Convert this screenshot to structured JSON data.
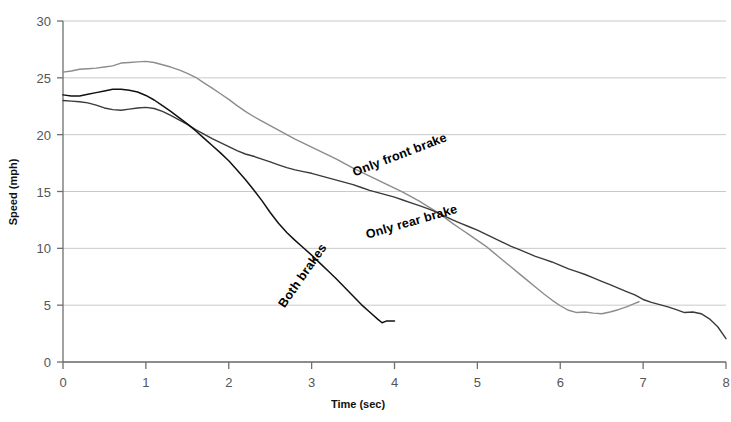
{
  "chart_data": {
    "type": "line",
    "title": "",
    "xlabel": "Time (sec)",
    "ylabel": "Speed (mph)",
    "xlim": [
      0,
      8
    ],
    "ylim": [
      0,
      30
    ],
    "xticks": [
      "0",
      "1",
      "2",
      "3",
      "4",
      "5",
      "6",
      "7",
      "8"
    ],
    "yticks": [
      "0",
      "5",
      "10",
      "15",
      "20",
      "25",
      "30"
    ],
    "grid": true,
    "legend_position": "inline-labels",
    "series": [
      {
        "name": "Only front brake",
        "color": "#8c8c8c",
        "label_x": 4.08,
        "label_y": 17.9,
        "label_rotation": -21,
        "x": [
          0.0,
          0.1,
          0.2,
          0.3,
          0.4,
          0.5,
          0.6,
          0.7,
          0.8,
          0.9,
          1.0,
          1.1,
          1.2,
          1.3,
          1.4,
          1.5,
          1.6,
          1.7,
          1.8,
          1.9,
          2.0,
          2.1,
          2.2,
          2.3,
          2.4,
          2.5,
          2.6,
          2.7,
          2.8,
          2.9,
          3.0,
          3.1,
          3.2,
          3.3,
          3.4,
          3.5,
          3.6,
          3.7,
          3.8,
          3.9,
          4.0,
          4.1,
          4.2,
          4.3,
          4.4,
          4.5,
          4.6,
          4.7,
          4.8,
          4.9,
          5.0,
          5.1,
          5.2,
          5.3,
          5.4,
          5.5,
          5.6,
          5.7,
          5.8,
          5.9,
          6.0,
          6.1,
          6.2,
          6.3,
          6.4,
          6.5,
          6.6,
          6.7,
          6.8,
          6.9,
          6.95
        ],
        "y": [
          25.5,
          25.6,
          25.75,
          25.8,
          25.85,
          25.95,
          26.05,
          26.3,
          26.35,
          26.4,
          26.45,
          26.35,
          26.15,
          25.95,
          25.7,
          25.4,
          25.05,
          24.55,
          24.1,
          23.6,
          23.1,
          22.55,
          22.05,
          21.6,
          21.2,
          20.8,
          20.4,
          20.0,
          19.6,
          19.25,
          18.9,
          18.55,
          18.2,
          17.85,
          17.45,
          17.05,
          16.7,
          16.35,
          16.0,
          15.65,
          15.3,
          14.95,
          14.55,
          14.15,
          13.7,
          13.25,
          12.75,
          12.2,
          11.7,
          11.2,
          10.7,
          10.2,
          9.6,
          9.0,
          8.4,
          7.8,
          7.2,
          6.6,
          6.0,
          5.45,
          4.95,
          4.55,
          4.35,
          4.4,
          4.3,
          4.25,
          4.4,
          4.6,
          4.85,
          5.15,
          5.3
        ]
      },
      {
        "name": "Only rear brake",
        "color": "#3a3a3a",
        "label_x": 4.22,
        "label_y": 12.0,
        "label_rotation": -16,
        "x": [
          0.0,
          0.1,
          0.2,
          0.3,
          0.4,
          0.5,
          0.6,
          0.7,
          0.8,
          0.9,
          1.0,
          1.1,
          1.2,
          1.3,
          1.4,
          1.5,
          1.6,
          1.7,
          1.8,
          1.9,
          2.0,
          2.1,
          2.2,
          2.3,
          2.4,
          2.5,
          2.6,
          2.7,
          2.8,
          2.9,
          3.0,
          3.1,
          3.2,
          3.3,
          3.4,
          3.5,
          3.6,
          3.7,
          3.8,
          3.9,
          4.0,
          4.1,
          4.2,
          4.3,
          4.4,
          4.5,
          4.6,
          4.7,
          4.8,
          4.9,
          5.0,
          5.1,
          5.2,
          5.3,
          5.4,
          5.5,
          5.6,
          5.7,
          5.8,
          5.9,
          6.0,
          6.1,
          6.2,
          6.3,
          6.4,
          6.5,
          6.6,
          6.7,
          6.8,
          6.9,
          7.0,
          7.1,
          7.2,
          7.3,
          7.4,
          7.5,
          7.6,
          7.7,
          7.8,
          7.9,
          8.0
        ],
        "y": [
          23.0,
          22.95,
          22.9,
          22.8,
          22.6,
          22.35,
          22.2,
          22.15,
          22.25,
          22.35,
          22.4,
          22.3,
          22.05,
          21.7,
          21.3,
          20.9,
          20.45,
          20.05,
          19.65,
          19.3,
          18.95,
          18.6,
          18.3,
          18.1,
          17.85,
          17.6,
          17.35,
          17.1,
          16.9,
          16.75,
          16.6,
          16.4,
          16.2,
          16.0,
          15.8,
          15.6,
          15.35,
          15.1,
          14.9,
          14.7,
          14.5,
          14.25,
          14.0,
          13.75,
          13.5,
          13.2,
          12.85,
          12.5,
          12.2,
          11.9,
          11.6,
          11.25,
          10.9,
          10.55,
          10.2,
          9.9,
          9.6,
          9.3,
          9.05,
          8.8,
          8.5,
          8.2,
          7.95,
          7.7,
          7.4,
          7.1,
          6.8,
          6.5,
          6.2,
          5.9,
          5.5,
          5.25,
          5.05,
          4.85,
          4.6,
          4.35,
          4.4,
          4.25,
          3.8,
          3.1,
          2.05
        ]
      },
      {
        "name": "Both brakes",
        "color": "#111111",
        "label_x": 2.93,
        "label_y": 7.4,
        "label_rotation": -55,
        "x": [
          0.0,
          0.1,
          0.2,
          0.3,
          0.4,
          0.5,
          0.6,
          0.7,
          0.8,
          0.9,
          1.0,
          1.1,
          1.2,
          1.3,
          1.4,
          1.5,
          1.6,
          1.7,
          1.8,
          1.9,
          2.0,
          2.1,
          2.2,
          2.3,
          2.4,
          2.5,
          2.6,
          2.7,
          2.8,
          2.9,
          3.0,
          3.1,
          3.2,
          3.3,
          3.4,
          3.5,
          3.6,
          3.7,
          3.8,
          3.85,
          3.9,
          4.0
        ],
        "y": [
          23.5,
          23.4,
          23.4,
          23.55,
          23.7,
          23.85,
          24.0,
          24.0,
          23.9,
          23.75,
          23.45,
          23.05,
          22.55,
          22.05,
          21.5,
          20.95,
          20.35,
          19.7,
          19.05,
          18.4,
          17.7,
          16.9,
          16.05,
          15.15,
          14.2,
          13.15,
          12.2,
          11.4,
          10.7,
          10.05,
          9.4,
          8.7,
          8.0,
          7.3,
          6.55,
          5.8,
          5.05,
          4.4,
          3.75,
          3.45,
          3.6,
          3.6
        ]
      }
    ]
  }
}
